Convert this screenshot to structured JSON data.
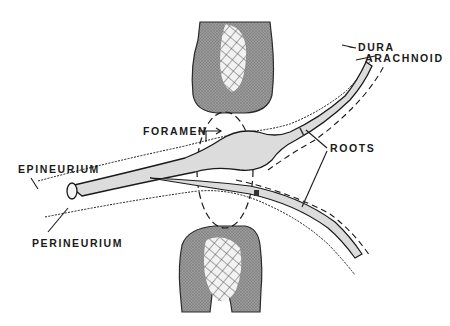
{
  "diagram": {
    "labels": {
      "dura": "DURA",
      "arachnoid": "ARACHNOID",
      "foramen": "FORAMEN",
      "roots": "ROOTS",
      "epineurium": "EPINEURIUM",
      "perineurium": "PERINEURIUM"
    },
    "structures": [
      {
        "name": "upper-bone",
        "description": "Upper vertebral pedicle (stippled bone with cross-hatched marrow)"
      },
      {
        "name": "lower-bone",
        "description": "Lower vertebral pedicle (stippled bone with cross-hatched marrow)"
      },
      {
        "name": "nerve-trunk",
        "description": "Spinal nerve trunk exiting to the left"
      },
      {
        "name": "dorsal-root-ganglion",
        "description": "Swelling on upper root within foramen"
      },
      {
        "name": "dorsal-root",
        "description": "Upper root curving to upper right"
      },
      {
        "name": "ventral-root",
        "description": "Lower root curving to lower right"
      },
      {
        "name": "foramen-outline",
        "description": "Dashed oval marking the foramen"
      }
    ],
    "colors": {
      "line": "#1a1a1a",
      "nerve_fill": "#dcdcdc",
      "bone_fill": "#8a8a8a",
      "marrow_fill": "#f4f4f4",
      "background": "#ffffff"
    }
  }
}
